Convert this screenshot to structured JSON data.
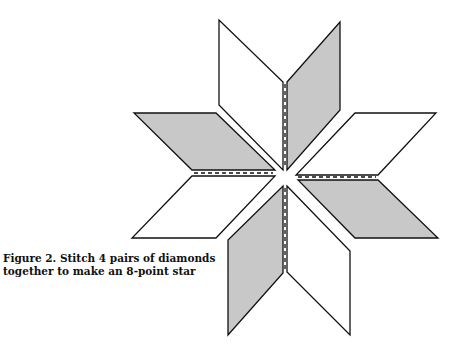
{
  "figure": {
    "caption_line1": "Figure 2.  Stitch 4 pairs of diamonds",
    "caption_line2": "together to make an 8-point star"
  },
  "colors": {
    "shaded": "#c8c8c8",
    "plain": "#ffffff",
    "stroke": "#111111"
  },
  "diamonds": [
    {
      "name": "top-left-diamond",
      "fill": "plain",
      "points": "219,20 219,105 283,170 283,82"
    },
    {
      "name": "top-right-diamond",
      "fill": "shaded",
      "points": "287,82 340,22 340,110 287,170"
    },
    {
      "name": "left-top-diamond",
      "fill": "shaded",
      "points": "134,113 216,113 275,170 192,170"
    },
    {
      "name": "left-bottom-diamond",
      "fill": "plain",
      "points": "192,176 275,176 216,238 132,238"
    },
    {
      "name": "right-top-diamond",
      "fill": "plain",
      "points": "355,113 436,113 378,175 296,175"
    },
    {
      "name": "right-bottom-diamond",
      "fill": "shaded",
      "points": "298,180 378,180 438,238 355,238"
    },
    {
      "name": "bottom-left-diamond",
      "fill": "shaded",
      "points": "283,186 283,273 228,335 228,240"
    },
    {
      "name": "bottom-right-diamond",
      "fill": "plain",
      "points": "287,186 350,251 350,335 287,272"
    }
  ],
  "seams": [
    {
      "name": "top-seam",
      "x1": 285,
      "y1": 84,
      "x2": 285,
      "y2": 168
    },
    {
      "name": "left-seam",
      "x1": 194,
      "y1": 173,
      "x2": 273,
      "y2": 173
    },
    {
      "name": "right-seam",
      "x1": 298,
      "y1": 177,
      "x2": 376,
      "y2": 177
    },
    {
      "name": "bottom-seam",
      "x1": 285,
      "y1": 188,
      "x2": 285,
      "y2": 271
    }
  ]
}
